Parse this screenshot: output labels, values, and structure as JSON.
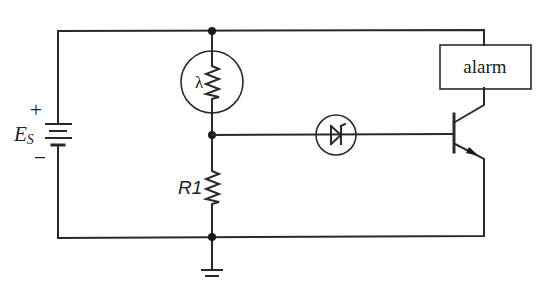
{
  "diagram": {
    "type": "circuit-schematic",
    "colors": {
      "line": "#2a2a2a",
      "background": "#ffffff"
    },
    "components": {
      "source": {
        "label": "E",
        "subscript": "S",
        "plus": "+",
        "minus": "−",
        "kind": "battery"
      },
      "photoresistor": {
        "symbol": "λ",
        "kind": "light-dependent-resistor"
      },
      "resistor": {
        "label": "R1",
        "kind": "resistor"
      },
      "zener": {
        "kind": "zener-diode"
      },
      "transistor": {
        "kind": "npn-bjt"
      },
      "alarm": {
        "label": "alarm",
        "kind": "load"
      },
      "ground": {
        "kind": "ground"
      }
    }
  }
}
